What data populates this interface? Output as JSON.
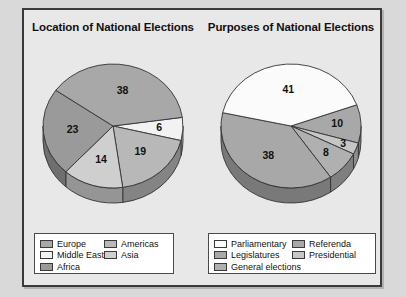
{
  "figure": {
    "background_color": "#e8e8e8",
    "page_background_color": "#d9d9d9",
    "border_color": "#3a3a3a"
  },
  "chart_data": [
    {
      "type": "pie",
      "title": "Location of National Elections",
      "xlabel": "",
      "ylabel": "",
      "legend_position": "bottom",
      "categories": [
        "Europe",
        "Middle East",
        "Americas",
        "Asia",
        "Africa"
      ],
      "values": [
        38,
        6,
        19,
        14,
        23
      ],
      "labels": [
        "38",
        "6",
        "19",
        "14",
        "23"
      ],
      "colors": [
        "#a8a8a8",
        "#f2f2f2",
        "#b8b8b8",
        "#cfcfcf",
        "#9a9a9a"
      ],
      "legend": [
        {
          "label": "Europe",
          "color": "#a8a8a8"
        },
        {
          "label": "Americas",
          "color": "#b8b8b8"
        },
        {
          "label": "Middle East",
          "color": "#f2f2f2"
        },
        {
          "label": "Asia",
          "color": "#cfcfcf"
        },
        {
          "label": "Africa",
          "color": "#9a9a9a"
        }
      ]
    },
    {
      "type": "pie",
      "title": "Purposes of National Elections",
      "xlabel": "",
      "ylabel": "",
      "legend_position": "bottom",
      "categories": [
        "Parliamentary",
        "Referenda",
        "Presidential",
        "General elections",
        "Legislatures"
      ],
      "values": [
        41,
        10,
        3,
        8,
        38
      ],
      "labels": [
        "41",
        "10",
        "3",
        "8",
        "38"
      ],
      "colors": [
        "#fbfbfb",
        "#a8a8a8",
        "#c6c6c6",
        "#b0b0b0",
        "#a8a8a8"
      ],
      "legend": [
        {
          "label": "Parliamentary",
          "color": "#fbfbfb"
        },
        {
          "label": "Referenda",
          "color": "#a8a8a8"
        },
        {
          "label": "Legislatures",
          "color": "#a8a8a8"
        },
        {
          "label": "Presidential",
          "color": "#c6c6c6"
        },
        {
          "label": "General elections",
          "color": "#b0b0b0"
        }
      ]
    }
  ]
}
